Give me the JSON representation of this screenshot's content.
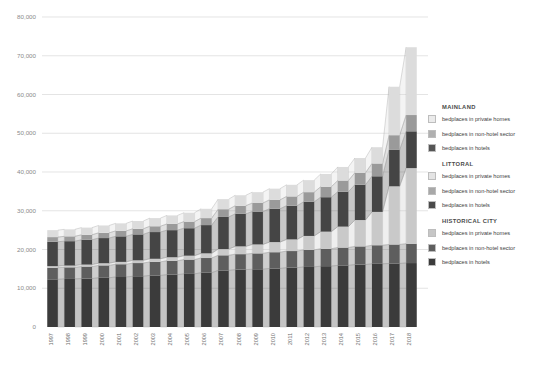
{
  "chart_data": {
    "type": "bar",
    "title": "",
    "subtitle": "",
    "xlabel": "",
    "ylabel": "",
    "stacked": true,
    "grid": true,
    "legend_position": "right",
    "ylim": [
      0,
      80000
    ],
    "yticks": [
      "0",
      "10,000",
      "20,000",
      "30,000",
      "40,000",
      "50,000",
      "60,000",
      "70,000",
      "80,000"
    ],
    "ytick_values": [
      0,
      10000,
      20000,
      30000,
      40000,
      50000,
      60000,
      70000,
      80000
    ],
    "categories": [
      "1997",
      "1998",
      "1999",
      "2000",
      "2001",
      "2002",
      "2003",
      "2004",
      "2005",
      "2006",
      "2007",
      "2008",
      "2009",
      "2010",
      "2011",
      "2012",
      "2013",
      "2014",
      "2015",
      "2016",
      "2017",
      "2018"
    ],
    "series": [
      {
        "name": "HISTORICAL CITY - bedplaces in hotels",
        "group": "HISTORICAL CITY",
        "type": "bedplaces in hotels",
        "color": "#3b3b3b",
        "values": [
          12300,
          12400,
          12500,
          12700,
          12900,
          13100,
          13300,
          13500,
          13700,
          14000,
          14600,
          14800,
          14900,
          15100,
          15300,
          15500,
          15700,
          15900,
          16100,
          16300,
          16400,
          16500
        ]
      },
      {
        "name": "HISTORICAL CITY - bedplaces in non-hotel sector",
        "group": "HISTORICAL CITY",
        "type": "bedplaces in non-hotel sector",
        "color": "#5e5e5e",
        "values": [
          3000,
          3000,
          3100,
          3200,
          3300,
          3400,
          3500,
          3600,
          3700,
          3800,
          3900,
          4000,
          4100,
          4200,
          4300,
          4400,
          4500,
          4600,
          4700,
          4800,
          4900,
          5000
        ]
      },
      {
        "name": "HISTORICAL CITY - bedplaces in private homes",
        "group": "HISTORICAL CITY",
        "type": "bedplaces in private homes",
        "color": "#c9c9c9",
        "values": [
          400,
          450,
          500,
          550,
          600,
          700,
          800,
          900,
          1000,
          1200,
          1600,
          2000,
          2300,
          2600,
          3000,
          3600,
          4400,
          5400,
          6800,
          8600,
          15000,
          19500
        ]
      },
      {
        "name": "LITTORAL - bedplaces in hotels",
        "group": "LITTORAL",
        "type": "bedplaces in hotels",
        "color": "#454545",
        "values": [
          6300,
          6300,
          6400,
          6500,
          6600,
          6700,
          6900,
          7000,
          7100,
          7300,
          8300,
          8400,
          8500,
          8600,
          8700,
          8800,
          8900,
          9000,
          9100,
          9200,
          9400,
          9500
        ]
      },
      {
        "name": "LITTORAL - bedplaces in non-hotel sector",
        "group": "LITTORAL",
        "type": "bedplaces in non-hotel sector",
        "color": "#9a9a9a",
        "values": [
          1200,
          1250,
          1300,
          1350,
          1400,
          1450,
          1500,
          1600,
          1700,
          1800,
          2000,
          2100,
          2200,
          2300,
          2400,
          2500,
          2700,
          2900,
          3100,
          3300,
          3800,
          4200
        ]
      },
      {
        "name": "MAINLAND - bedplaces in private homes",
        "group": "MAINLAND",
        "type": "bedplaces in private homes",
        "color": "#dcdcdc",
        "values": [
          1800,
          1800,
          1850,
          1900,
          1950,
          2000,
          2100,
          2200,
          2300,
          2400,
          2600,
          2700,
          2800,
          2900,
          3000,
          3100,
          3300,
          3500,
          3800,
          4200,
          12500,
          17500
        ]
      }
    ],
    "totals": [
      25000,
      25200,
      25650,
      26200,
      26750,
      27350,
      28100,
      28800,
      29500,
      30500,
      33000,
      34000,
      34800,
      35700,
      36700,
      37900,
      39500,
      41300,
      43600,
      46400,
      61900,
      72200
    ]
  },
  "legend": {
    "groups": [
      {
        "title": "MAINLAND",
        "items": [
          {
            "label": "bedplaces in private homes",
            "color": "#ebebeb"
          },
          {
            "label": "bedplaces in non-hotel sector",
            "color": "#b0b0b0"
          },
          {
            "label": "bedplaces in hotels",
            "color": "#555555"
          }
        ]
      },
      {
        "title": "LITTORAL",
        "items": [
          {
            "label": "bedplaces in private homes",
            "color": "#e4e4e4"
          },
          {
            "label": "bedplaces in non-hotel sector",
            "color": "#a8a8a8"
          },
          {
            "label": "bedplaces in hotels",
            "color": "#4a4a4a"
          }
        ]
      },
      {
        "title": "HISTORICAL CITY",
        "items": [
          {
            "label": "bedplaces in private homes",
            "color": "#c6c6c6"
          },
          {
            "label": "bedplaces in non-hotel sector",
            "color": "#5e5e5e"
          },
          {
            "label": "bedplaces in hotels",
            "color": "#3b3b3b"
          }
        ]
      }
    ]
  }
}
